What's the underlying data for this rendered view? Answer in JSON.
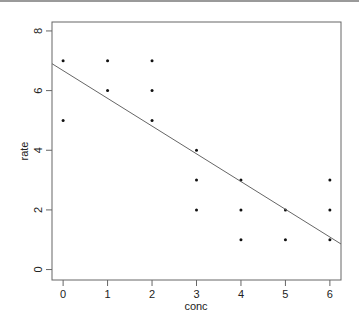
{
  "chart_data": {
    "type": "scatter",
    "title": "",
    "xlabel": "conc",
    "ylabel": "rate",
    "xlim": [
      -0.25,
      6.25
    ],
    "ylim": [
      -0.35,
      8.3
    ],
    "x_ticks": [
      0,
      1,
      2,
      3,
      4,
      5,
      6
    ],
    "y_ticks": [
      0,
      2,
      4,
      6,
      8
    ],
    "grid": false,
    "legend": null,
    "points": [
      {
        "x": 0,
        "y": 7
      },
      {
        "x": 0,
        "y": 5
      },
      {
        "x": 1,
        "y": 7
      },
      {
        "x": 1,
        "y": 6
      },
      {
        "x": 2,
        "y": 7
      },
      {
        "x": 2,
        "y": 6
      },
      {
        "x": 2,
        "y": 5
      },
      {
        "x": 3,
        "y": 4
      },
      {
        "x": 3,
        "y": 3
      },
      {
        "x": 3,
        "y": 2
      },
      {
        "x": 4,
        "y": 3
      },
      {
        "x": 4,
        "y": 2
      },
      {
        "x": 4,
        "y": 1
      },
      {
        "x": 5,
        "y": 2
      },
      {
        "x": 5,
        "y": 1
      },
      {
        "x": 6,
        "y": 3
      },
      {
        "x": 6,
        "y": 2
      },
      {
        "x": 6,
        "y": 1
      }
    ],
    "regression_line": {
      "intercept": 6.67,
      "slope": -0.93
    }
  },
  "axes": {
    "xlabel": "conc",
    "ylabel": "rate",
    "x_tick_labels": [
      "0",
      "1",
      "2",
      "3",
      "4",
      "5",
      "6"
    ],
    "y_tick_labels": [
      "0",
      "2",
      "4",
      "6",
      "8"
    ]
  },
  "colors": {
    "points": "#111111",
    "line": "#666666",
    "axes": "#666666",
    "text": "#222222"
  }
}
